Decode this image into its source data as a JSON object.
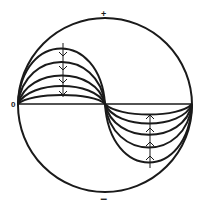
{
  "diagram": {
    "type": "circle-with-standing-wave-loops",
    "labels": {
      "top": "+",
      "bottom": "−",
      "left": "0"
    },
    "stroke_color": "#1a1a1a",
    "background": "#ffffff",
    "upper_loops": {
      "count": 5,
      "direction": "down",
      "arrows": 4
    },
    "lower_loops": {
      "count": 5,
      "direction": "up",
      "arrows": 4
    }
  }
}
